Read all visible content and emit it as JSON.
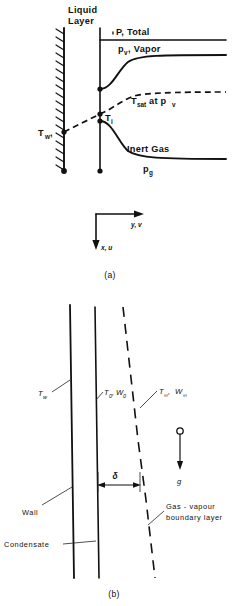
{
  "figure": {
    "panel_a": {
      "caption": "(a)",
      "labels": {
        "liquid_layer_line1": "Liquid",
        "liquid_layer_line2": "Layer",
        "total_pressure": "P, Total",
        "vapor_pressure_main": "p",
        "vapor_pressure_sub": "v",
        "vapor_pressure_rest": ", Vapor",
        "t_sat_main": "T",
        "t_sat_sub": "sat",
        "t_sat_rest": " at p",
        "t_sat_rest_sub": "v",
        "t_interface_main": "T",
        "t_interface_sub": "i",
        "t_wall_main": "T",
        "t_wall_sub": "w",
        "inert_gas": "Inert  Gas",
        "gas_pressure_main": "p",
        "gas_pressure_sub": "g"
      },
      "axes": {
        "horizontal": "y, v",
        "vertical": "x, u"
      }
    },
    "panel_b": {
      "caption": "(b)",
      "labels": {
        "t_wall_main": "T",
        "t_wall_sub": "w",
        "t_zero_main": "T",
        "t_zero_sub": "0",
        "w_zero_sep": ", ",
        "w_zero_main": "W",
        "w_zero_sub": "0",
        "t_inf_main": "T",
        "t_inf_sub": "∞",
        "w_inf_sep": " , ",
        "w_inf_main": "W",
        "w_inf_sub": "∞",
        "delta": "δ",
        "gravity": "g",
        "wall": "Wall",
        "condensate": "Condensate",
        "boundary_line1": "Gas - vapour",
        "boundary_line2": "boundary  layer"
      }
    }
  },
  "colors": {
    "ink": "#111111",
    "background": "#ffffff"
  }
}
